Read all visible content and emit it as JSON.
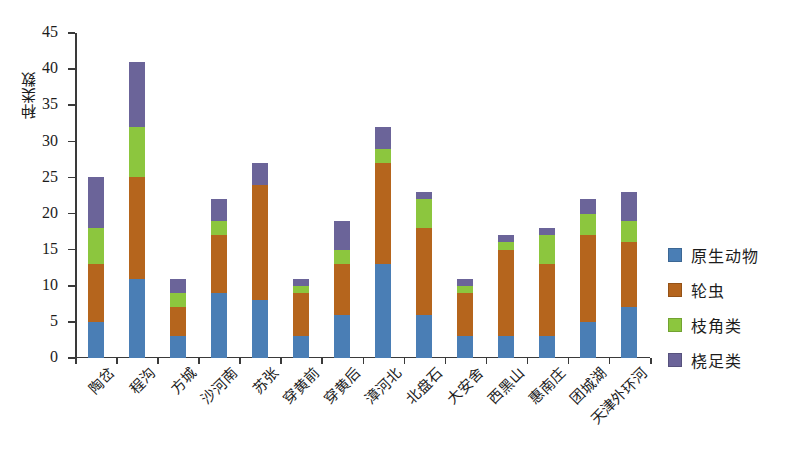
{
  "chart_data": {
    "type": "bar",
    "stacked": true,
    "title": "",
    "xlabel": "",
    "ylabel": "种类数",
    "ylim": [
      0,
      45
    ],
    "ytick_step": 5,
    "yticks": [
      0,
      5,
      10,
      15,
      20,
      25,
      30,
      35,
      40,
      45
    ],
    "grid": false,
    "legend_position": "right",
    "categories": [
      "陶岔",
      "程沟",
      "方城",
      "沙河南",
      "苏张",
      "穿黄前",
      "穿黄后",
      "漳河北",
      "北盘石",
      "大安舍",
      "西黑山",
      "惠南庄",
      "团城湖",
      "天津外环河"
    ],
    "series": [
      {
        "name": "原生动物",
        "color": "#4a7eb5",
        "values": [
          5,
          11,
          3,
          9,
          8,
          3,
          6,
          13,
          6,
          3,
          3,
          3,
          5,
          7
        ]
      },
      {
        "name": "轮虫",
        "color": "#b5651d",
        "values": [
          8,
          14,
          4,
          8,
          16,
          6,
          7,
          14,
          12,
          6,
          12,
          10,
          12,
          9
        ]
      },
      {
        "name": "枝角类",
        "color": "#8cc63e",
        "values": [
          5,
          7,
          2,
          2,
          0,
          1,
          2,
          2,
          4,
          1,
          1,
          4,
          3,
          3
        ]
      },
      {
        "name": "桡足类",
        "color": "#6b6499",
        "values": [
          7,
          9,
          2,
          3,
          3,
          1,
          4,
          3,
          1,
          1,
          1,
          1,
          2,
          4
        ]
      }
    ],
    "totals": [
      25,
      41,
      11,
      22,
      27,
      11,
      19,
      32,
      23,
      11,
      17,
      18,
      22,
      23
    ]
  },
  "legend": {
    "items": [
      {
        "label": "原生动物",
        "color": "#4a7eb5"
      },
      {
        "label": "轮虫",
        "color": "#b5651d"
      },
      {
        "label": "枝角类",
        "color": "#8cc63e"
      },
      {
        "label": "桡足类",
        "color": "#6b6499"
      }
    ]
  }
}
